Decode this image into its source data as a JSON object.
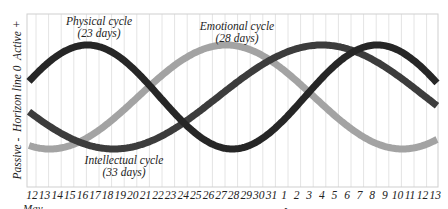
{
  "chart_data": {
    "type": "line",
    "title": "",
    "ylabel": "Passive -  Horizon line 0  Active +",
    "xlabel": "",
    "months": [
      {
        "label": "May",
        "start_index": 0
      },
      {
        "label": "June",
        "start_index": 20
      }
    ],
    "categories": [
      "12",
      "13",
      "14",
      "15",
      "16",
      "17",
      "18",
      "19",
      "20",
      "21",
      "22",
      "23",
      "24",
      "25",
      "26",
      "27",
      "28",
      "29",
      "30",
      "31",
      "1",
      "2",
      "3",
      "4",
      "5",
      "6",
      "7",
      "8",
      "9",
      "10",
      "11",
      "12",
      "13"
    ],
    "ylim": [
      -1,
      1
    ],
    "grid": {
      "vertical": true,
      "horizontal": false
    },
    "legend": "inline annotations",
    "series": [
      {
        "name": "Physical cycle",
        "period_days": 23,
        "label_line1": "Physical cycle",
        "label_line2": "(23 days)",
        "color": "#262626",
        "peak_day_index": 4.4,
        "values": [
          0.15,
          0.55,
          0.85,
          0.99,
          1.0,
          0.87,
          0.6,
          0.24,
          -0.15,
          -0.52,
          -0.82,
          -0.98,
          -0.99,
          -0.86,
          -0.6,
          -0.24,
          0.15,
          0.52,
          0.82,
          0.98,
          1.0,
          0.88,
          0.62,
          0.27,
          -0.12,
          -0.5,
          -0.8,
          -0.97,
          -0.99,
          -0.87,
          -0.62,
          -0.27,
          0.1
        ]
      },
      {
        "name": "Emotional cycle",
        "period_days": 28,
        "label_line1": "Emotional cycle",
        "label_line2": "(28 days)",
        "color": "#a3a3a3",
        "peak_day_index": 15.4,
        "values": [
          -0.95,
          -1.0,
          -0.96,
          -0.83,
          -0.62,
          -0.35,
          -0.05,
          0.25,
          0.52,
          0.76,
          0.92,
          0.99,
          0.99,
          0.92,
          0.77,
          0.55,
          0.28,
          -0.02,
          -0.3,
          -0.57,
          -0.79,
          -0.94,
          -1.0,
          -0.97,
          -0.85,
          -0.65,
          -0.39,
          -0.1,
          0.2,
          0.48,
          0.72,
          0.89,
          0.98
        ]
      },
      {
        "name": "Intellectual cycle",
        "period_days": 33,
        "label_line1": "Intellectual cycle",
        "label_line2": "(33 days)",
        "color": "#3c3c3c",
        "peak_day_index": 23,
        "values": [
          -0.4,
          -0.59,
          -0.76,
          -0.88,
          -0.96,
          -1.0,
          -0.99,
          -0.94,
          -0.85,
          -0.71,
          -0.55,
          -0.36,
          -0.15,
          0.05,
          0.26,
          0.45,
          0.62,
          0.77,
          0.89,
          0.96,
          1.0,
          1.0,
          0.96,
          0.88,
          0.77,
          0.62,
          0.45,
          0.26,
          0.05,
          -0.15,
          -0.35,
          -0.53,
          -0.69
        ]
      }
    ]
  }
}
